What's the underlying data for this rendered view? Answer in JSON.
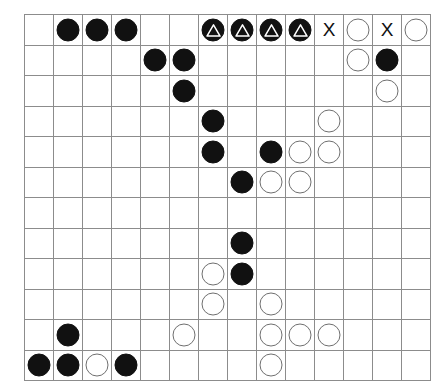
{
  "board": {
    "name": "go-board-diagram",
    "columns": 14,
    "rows": 12,
    "grid_line_color": "#8c8c8c",
    "border_color": "#9a9a9a",
    "background_color": "#ffffff",
    "black_stone_color": "#111111",
    "white_stone_color": "#ffffff",
    "white_stone_border_color": "#6f6f6f",
    "marker_color": "#ffffff",
    "x_mark_label": "X",
    "legend": {
      "black": "black-stone",
      "white": "white-stone",
      "black_triangle": "black-stone-with-triangle-marker",
      "x": "x-mark",
      "empty": "empty-intersection"
    },
    "cells": [
      [
        "",
        "B",
        "B",
        "B",
        "",
        "",
        "BT",
        "BT",
        "BT",
        "BT",
        "X",
        "W",
        "X",
        "W"
      ],
      [
        "",
        "",
        "",
        "",
        "B",
        "B",
        "",
        "",
        "",
        "",
        "",
        "W",
        "B",
        ""
      ],
      [
        "",
        "",
        "",
        "",
        "",
        "B",
        "",
        "",
        "",
        "",
        "",
        "",
        "W",
        ""
      ],
      [
        "",
        "",
        "",
        "",
        "",
        "",
        "B",
        "",
        "",
        "",
        "W",
        "",
        "",
        ""
      ],
      [
        "",
        "",
        "",
        "",
        "",
        "",
        "B",
        "",
        "B",
        "W",
        "W",
        "",
        "",
        ""
      ],
      [
        "",
        "",
        "",
        "",
        "",
        "",
        "",
        "B",
        "W",
        "W",
        "",
        "",
        "",
        ""
      ],
      [
        "",
        "",
        "",
        "",
        "",
        "",
        "",
        "",
        "",
        "",
        "",
        "",
        "",
        ""
      ],
      [
        "",
        "",
        "",
        "",
        "",
        "",
        "",
        "B",
        "",
        "",
        "",
        "",
        "",
        ""
      ],
      [
        "",
        "",
        "",
        "",
        "",
        "",
        "W",
        "B",
        "",
        "",
        "",
        "",
        "",
        ""
      ],
      [
        "",
        "",
        "",
        "",
        "",
        "",
        "W",
        "",
        "W",
        "",
        "",
        "",
        "",
        ""
      ],
      [
        "",
        "B",
        "",
        "",
        "",
        "W",
        "",
        "",
        "W",
        "W",
        "W",
        "",
        "",
        ""
      ],
      [
        "B",
        "B",
        "W",
        "B",
        "",
        "",
        "",
        "",
        "W",
        "",
        "",
        "",
        "",
        ""
      ]
    ]
  }
}
